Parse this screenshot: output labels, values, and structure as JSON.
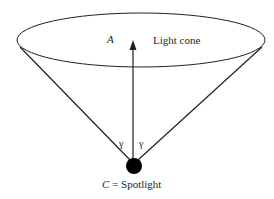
{
  "diagram": {
    "labels": {
      "axis": "A",
      "cone": "Light cone",
      "angle_left": "γ",
      "angle_right": "γ",
      "spotlight_var": "C",
      "spotlight_text": " = Spotlight"
    },
    "colors": {
      "stroke": "#231f20",
      "background": "#ffffff"
    }
  }
}
